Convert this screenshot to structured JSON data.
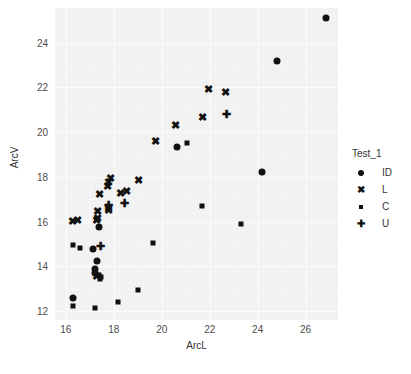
{
  "chart_data": {
    "type": "scatter",
    "title": "",
    "xlabel": "ArcL",
    "ylabel": "ArcV",
    "xlim": [
      15.55,
      27.35
    ],
    "ylim": [
      11.6,
      25.55
    ],
    "xticks": [
      16,
      18,
      20,
      22,
      24,
      26
    ],
    "yticks": [
      12,
      14,
      16,
      18,
      20,
      22,
      24
    ],
    "grid": true,
    "legend": {
      "title": "Test_1",
      "position": "right",
      "entries": [
        {
          "label": "ID",
          "marker": "circle"
        },
        {
          "label": "L",
          "marker": "x"
        },
        {
          "label": "C",
          "marker": "square"
        },
        {
          "label": "U",
          "marker": "plus"
        }
      ]
    },
    "series": [
      {
        "name": "ID",
        "marker": "circle",
        "points": [
          {
            "x": 16.32,
            "y": 12.57
          },
          {
            "x": 17.12,
            "y": 14.78
          },
          {
            "x": 17.3,
            "y": 14.22
          },
          {
            "x": 17.22,
            "y": 13.88
          },
          {
            "x": 17.2,
            "y": 13.72
          },
          {
            "x": 17.4,
            "y": 15.78
          },
          {
            "x": 20.62,
            "y": 19.32
          },
          {
            "x": 24.18,
            "y": 18.22
          },
          {
            "x": 24.8,
            "y": 23.2
          },
          {
            "x": 26.85,
            "y": 25.12
          }
        ]
      },
      {
        "name": "L",
        "marker": "x",
        "points": [
          {
            "x": 16.28,
            "y": 16.03
          },
          {
            "x": 16.48,
            "y": 16.05
          },
          {
            "x": 17.32,
            "y": 16.48
          },
          {
            "x": 17.34,
            "y": 16.18
          },
          {
            "x": 17.3,
            "y": 16.05
          },
          {
            "x": 17.28,
            "y": 13.55
          },
          {
            "x": 17.42,
            "y": 17.22
          },
          {
            "x": 17.72,
            "y": 17.58
          },
          {
            "x": 17.8,
            "y": 17.78
          },
          {
            "x": 17.88,
            "y": 17.95
          },
          {
            "x": 17.78,
            "y": 16.62
          },
          {
            "x": 17.8,
            "y": 16.52
          },
          {
            "x": 18.28,
            "y": 17.3
          },
          {
            "x": 18.52,
            "y": 17.35
          },
          {
            "x": 19.02,
            "y": 17.85
          },
          {
            "x": 19.72,
            "y": 19.62
          },
          {
            "x": 20.58,
            "y": 20.32
          },
          {
            "x": 21.72,
            "y": 20.68
          },
          {
            "x": 21.95,
            "y": 21.92
          },
          {
            "x": 22.68,
            "y": 21.78
          }
        ]
      },
      {
        "name": "C",
        "marker": "square",
        "points": [
          {
            "x": 16.32,
            "y": 12.22
          },
          {
            "x": 16.3,
            "y": 14.95
          },
          {
            "x": 16.6,
            "y": 14.82
          },
          {
            "x": 17.2,
            "y": 12.12
          },
          {
            "x": 17.42,
            "y": 13.45
          },
          {
            "x": 17.38,
            "y": 13.6
          },
          {
            "x": 17.48,
            "y": 13.52
          },
          {
            "x": 18.18,
            "y": 12.42
          },
          {
            "x": 19.02,
            "y": 12.92
          },
          {
            "x": 19.65,
            "y": 15.05
          },
          {
            "x": 21.05,
            "y": 19.5
          },
          {
            "x": 21.7,
            "y": 16.68
          },
          {
            "x": 23.32,
            "y": 15.88
          }
        ]
      },
      {
        "name": "U",
        "marker": "plus",
        "points": [
          {
            "x": 17.45,
            "y": 14.92
          },
          {
            "x": 17.78,
            "y": 16.72
          },
          {
            "x": 18.45,
            "y": 16.85
          },
          {
            "x": 22.72,
            "y": 20.82
          }
        ]
      }
    ]
  },
  "glyphs": {
    "x": "✖",
    "plus": "✚"
  },
  "colors": {
    "panel_background": "#f2f2f2",
    "grid": "#fbfbfb",
    "marker": "#111111",
    "text": "#333333"
  }
}
